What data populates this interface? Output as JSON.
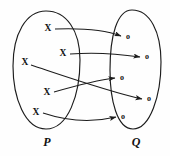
{
  "diagram": {
    "type": "mapping-diagram",
    "title": "",
    "stroke_color": "#1c1c1c",
    "background_color": "#fefefe",
    "sets": [
      {
        "id": "P",
        "label": "P",
        "label_x": 47,
        "label_y": 143,
        "outline": "M 46 11 C 66 11, 80 30, 80 60 C 80 95, 68 129, 46 129 C 25 129, 13 98, 13 66 C 13 34, 26 11, 46 11 Z",
        "elements": [
          {
            "id": "p1",
            "glyph": "X",
            "x": 48,
            "y": 29
          },
          {
            "id": "p2",
            "glyph": "X",
            "x": 63,
            "y": 54
          },
          {
            "id": "p3",
            "glyph": "X",
            "x": 25,
            "y": 63
          },
          {
            "id": "p4",
            "glyph": "X",
            "x": 47,
            "y": 93
          },
          {
            "id": "p5",
            "glyph": "X",
            "x": 36,
            "y": 113
          }
        ]
      },
      {
        "id": "Q",
        "label": "Q",
        "label_x": 136,
        "label_y": 143,
        "outline": "M 132 10 C 150 10, 161 32, 161 62 C 161 96, 150 129, 133 129 C 117 129, 110 100, 110 70 C 110 36, 117 10, 132 10 Z",
        "elements": [
          {
            "id": "q1",
            "glyph": "o",
            "x": 128,
            "y": 37
          },
          {
            "id": "q2",
            "glyph": "o",
            "x": 147,
            "y": 57
          },
          {
            "id": "q3",
            "glyph": "o",
            "x": 122,
            "y": 78
          },
          {
            "id": "q4",
            "glyph": "o",
            "x": 149,
            "y": 99
          },
          {
            "id": "q5",
            "glyph": "o",
            "x": 123,
            "y": 117
          }
        ]
      }
    ],
    "arrows": [
      {
        "id": "a1",
        "from": "p1",
        "to": "q1",
        "path": "M 55 29 C 80 28, 105 30, 121 36"
      },
      {
        "id": "a2",
        "from": "p2",
        "to": "q2",
        "path": "M 70 54 C 95 52, 120 54, 140 57"
      },
      {
        "id": "a3",
        "from": "p3",
        "to": "q4",
        "path": "M 31 65 C 70 78, 110 92, 142 99"
      },
      {
        "id": "a4",
        "from": "p4",
        "to": "q3",
        "path": "M 54 92 C 75 86, 98 80, 115 78"
      },
      {
        "id": "a5",
        "from": "p5",
        "to": "q5",
        "path": "M 43 113 C 70 122, 95 122, 116 117"
      }
    ],
    "arrowhead": {
      "id": "arrow-marker",
      "path": "M 0 0 L 7 2.6 L 0 5.2 L 1.6 2.6 Z"
    }
  }
}
